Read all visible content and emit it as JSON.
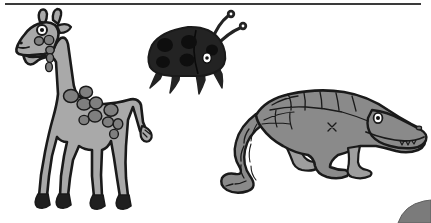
{
  "artwork": {
    "title": "Cartoon animals illustration",
    "description": "Black-and-white clip-art style drawing of three animals on a white page",
    "background_color": "#ffffff",
    "page_rule": {
      "name": "top-border-rule",
      "color": "#3a3a3a"
    },
    "corner_mark": {
      "name": "bottom-right-corner-shape",
      "color": "#7b7b7b"
    },
    "palette": {
      "outline": "#1a1a1a",
      "giraffe_body": "#a9a9a9",
      "giraffe_spot": "#7f7f7f",
      "giraffe_hoof": "#1f1f1f",
      "beetle_body": "#232323",
      "beetle_spot": "#0e0e0e",
      "crocodile_body": "#8a8a8a",
      "crocodile_belly": "#9e9e9e",
      "eye_white": "#ffffff",
      "eye_pupil": "#141414"
    },
    "figures": [
      {
        "id": "giraffe",
        "label": "Giraffe",
        "position": "left",
        "fill": "#a9a9a9",
        "spot_fill": "#7f7f7f",
        "parts": [
          "head",
          "ossicones",
          "eye",
          "muzzle",
          "neck",
          "body",
          "tail",
          "four-legs",
          "hooves"
        ]
      },
      {
        "id": "beetle",
        "label": "Ladybug beetle",
        "position": "center-top",
        "fill": "#232323",
        "spot_fill": "#0e0e0e",
        "parts": [
          "shell",
          "spots",
          "head",
          "eye",
          "two-antennae",
          "legs"
        ]
      },
      {
        "id": "crocodile",
        "label": "Crocodile",
        "position": "right",
        "fill": "#8a8a8a",
        "spot_fill": "#6f6f6f",
        "parts": [
          "snout",
          "eye",
          "teeth",
          "back-scales",
          "body",
          "legs",
          "curved-tail"
        ]
      }
    ]
  }
}
